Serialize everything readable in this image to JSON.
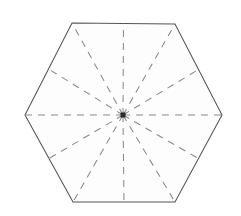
{
  "figure": {
    "name": "regular-hexagon-lines-of-symmetry",
    "canvas": {
      "width": 241,
      "height": 216
    },
    "background_color": "#ffffff",
    "shape": {
      "type": "regular-hexagon",
      "orientation": "flat-top",
      "sides": 6,
      "fill_color": "#fdfdfd",
      "outline_color": "#555558",
      "outline_width": 1.05,
      "vertices": [
        {
          "name": "top-left-vertex",
          "x": 72,
          "y": 23
        },
        {
          "name": "top-right-vertex",
          "x": 175,
          "y": 24
        },
        {
          "name": "right-vertex",
          "x": 222,
          "y": 115
        },
        {
          "name": "bottom-right-vertex",
          "x": 175,
          "y": 202
        },
        {
          "name": "bottom-left-vertex",
          "x": 73,
          "y": 202
        },
        {
          "name": "left-vertex",
          "x": 25,
          "y": 115
        }
      ],
      "edge_midpoints": [
        {
          "name": "top-edge-midpoint",
          "x": 123.5,
          "y": 23.5
        },
        {
          "name": "upper-right-edge-midpoint",
          "x": 198.5,
          "y": 69.5
        },
        {
          "name": "lower-right-edge-midpoint",
          "x": 198.5,
          "y": 158.5
        },
        {
          "name": "bottom-edge-midpoint",
          "x": 124,
          "y": 202
        },
        {
          "name": "lower-left-edge-midpoint",
          "x": 49,
          "y": 158.5
        },
        {
          "name": "upper-left-edge-midpoint",
          "x": 48.5,
          "y": 69
        }
      ]
    },
    "center": {
      "name": "center-point",
      "x": 123,
      "y": 115,
      "marker_shape": "square",
      "marker_size": 5,
      "marker_color": "#2b2b2e"
    },
    "symmetry_lines": {
      "count": 12,
      "color": "#8a8a8e",
      "width": 1.05,
      "dash_length": 7,
      "gap_length": 6,
      "angle_step_degrees": 30,
      "radii": [
        {
          "name": "spoke-to-top-left-vertex",
          "x": 72,
          "y": 23
        },
        {
          "name": "spoke-to-top-edge-midpoint",
          "x": 123.5,
          "y": 23.5
        },
        {
          "name": "spoke-to-top-right-vertex",
          "x": 175,
          "y": 24
        },
        {
          "name": "spoke-to-upper-right-edge-midpoint",
          "x": 198.5,
          "y": 69.5
        },
        {
          "name": "spoke-to-right-vertex",
          "x": 222,
          "y": 115
        },
        {
          "name": "spoke-to-lower-right-edge-midpoint",
          "x": 198.5,
          "y": 158.5
        },
        {
          "name": "spoke-to-bottom-right-vertex",
          "x": 175,
          "y": 202
        },
        {
          "name": "spoke-to-bottom-edge-midpoint",
          "x": 124,
          "y": 202
        },
        {
          "name": "spoke-to-bottom-left-vertex",
          "x": 73,
          "y": 202
        },
        {
          "name": "spoke-to-lower-left-edge-midpoint",
          "x": 49,
          "y": 158.5
        },
        {
          "name": "spoke-to-left-vertex",
          "x": 25,
          "y": 115
        },
        {
          "name": "spoke-to-upper-left-edge-midpoint",
          "x": 48.5,
          "y": 69
        }
      ]
    }
  }
}
